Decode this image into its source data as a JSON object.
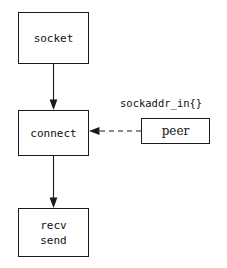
{
  "diagram": {
    "background_color": "#ffffff",
    "stroke_color": "#1a1a1a",
    "nodes": [
      {
        "id": "socket",
        "label": "socket",
        "lines": [
          "socket"
        ],
        "font": "mono"
      },
      {
        "id": "connect",
        "label": "connect",
        "lines": [
          "connect"
        ],
        "font": "mono"
      },
      {
        "id": "peer",
        "label": "peer",
        "lines": [
          "peer"
        ],
        "font": "serif"
      },
      {
        "id": "recv-send",
        "label": "recv send",
        "lines": [
          "recv",
          "send"
        ],
        "font": "mono"
      }
    ],
    "annotations": [
      {
        "id": "sockaddr-struct",
        "text": "sockaddr_in{}"
      }
    ],
    "edges": [
      {
        "id": "socket-to-connect",
        "from": "socket",
        "to": "connect",
        "style": "solid",
        "direction": "down",
        "arrowhead": "filled-triangle"
      },
      {
        "id": "peer-to-connect",
        "from": "peer",
        "to": "connect",
        "style": "dashed",
        "direction": "left",
        "arrowhead": "filled-triangle"
      },
      {
        "id": "connect-to-recv-send",
        "from": "connect",
        "to": "recv-send",
        "style": "solid",
        "direction": "down",
        "arrowhead": "filled-triangle"
      }
    ]
  }
}
